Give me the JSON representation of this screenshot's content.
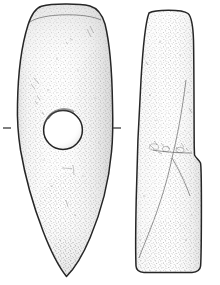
{
  "plate": {
    "title": "Perforated stone axe-hammer",
    "caption": "",
    "background_color": "#ffffff",
    "ink_color": "#2b2b2b",
    "stipple_color": "#6a6a6a",
    "fill_color": "#fdfdfd"
  },
  "objects": [
    {
      "id": "axe-hammer-face-view",
      "label": "Axe-hammer, face view",
      "view": "face",
      "outline_color": "#2b2b2b",
      "shape": "lenticular leaf-shaped blade, rounded butt above, pointed blade below",
      "perforation": {
        "label": "shaft-hole perforation",
        "center_x": 63,
        "center_y": 130,
        "radius": 19,
        "shape": "circular"
      }
    },
    {
      "id": "axe-hammer-side-view",
      "label": "Axe-hammer, side view",
      "view": "profile",
      "outline_color": "#2b2b2b",
      "shape": "elongated wedge with rounded butt, stepped shoulder at mid-right, flat base"
    }
  ],
  "registration_marks": [
    {
      "id": "tick-left",
      "label": "left axis tick",
      "x1": 3,
      "x2": 11,
      "y": 128
    },
    {
      "id": "tick-right",
      "label": "right axis tick",
      "x1": 113,
      "x2": 121,
      "y": 128
    }
  ]
}
